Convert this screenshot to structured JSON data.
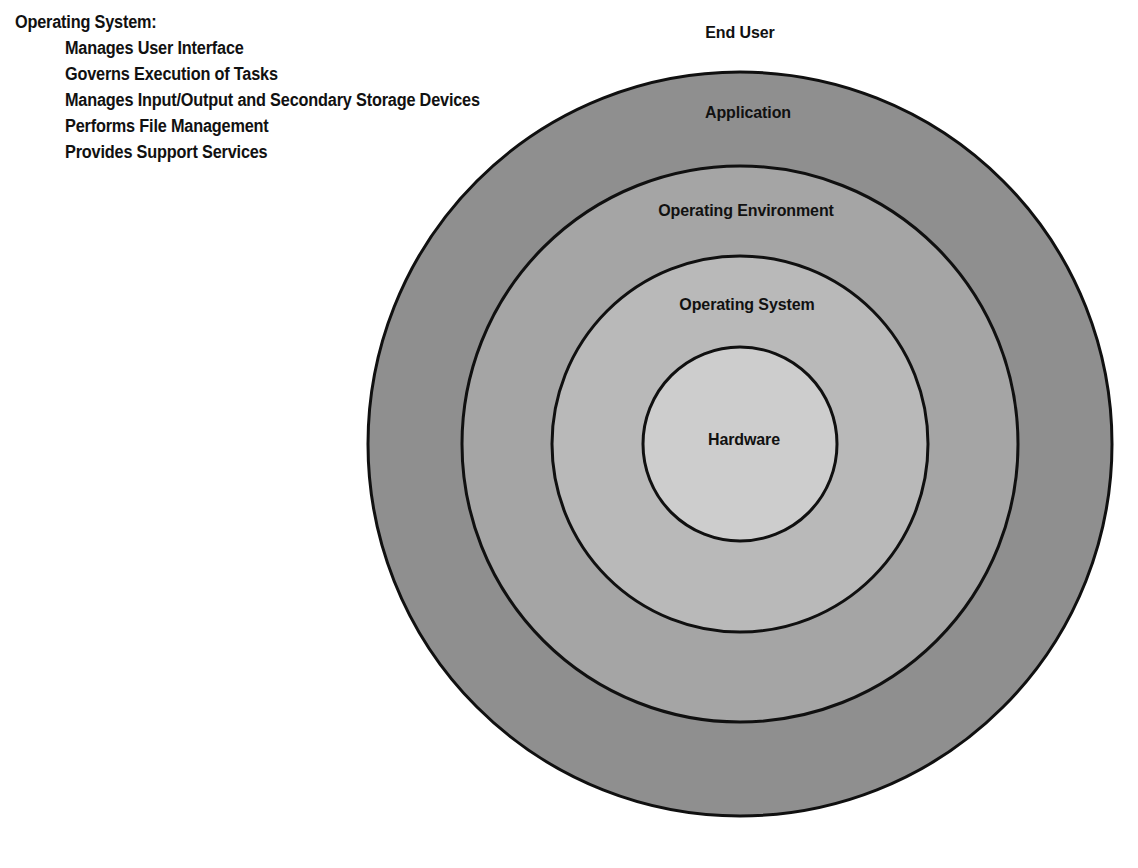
{
  "caption": {
    "heading": "Operating System:",
    "items": [
      "Manages User Interface",
      "Governs Execution of Tasks",
      "Manages Input/Output and Secondary Storage Devices",
      "Performs File Management",
      "Provides Support Services"
    ]
  },
  "diagram": {
    "type": "concentric-rings",
    "center_x": 740,
    "center_y": 444,
    "external_label": {
      "text": "End User",
      "x": 740,
      "y": 23
    },
    "rings": [
      {
        "label": "Application",
        "radius": 372,
        "fill": "#8f8f8f",
        "stroke": "#101010",
        "label_x": 748,
        "label_y": 103
      },
      {
        "label": "Operating Environment",
        "radius": 278,
        "fill": "#a5a5a5",
        "stroke": "#101010",
        "label_x": 746,
        "label_y": 201
      },
      {
        "label": "Operating System",
        "radius": 188,
        "fill": "#b9b9b9",
        "stroke": "#101010",
        "label_x": 747,
        "label_y": 295
      },
      {
        "label": "Hardware",
        "radius": 97,
        "fill": "#cdcdcd",
        "stroke": "#101010",
        "label_x": 744,
        "label_y": 430
      }
    ]
  }
}
